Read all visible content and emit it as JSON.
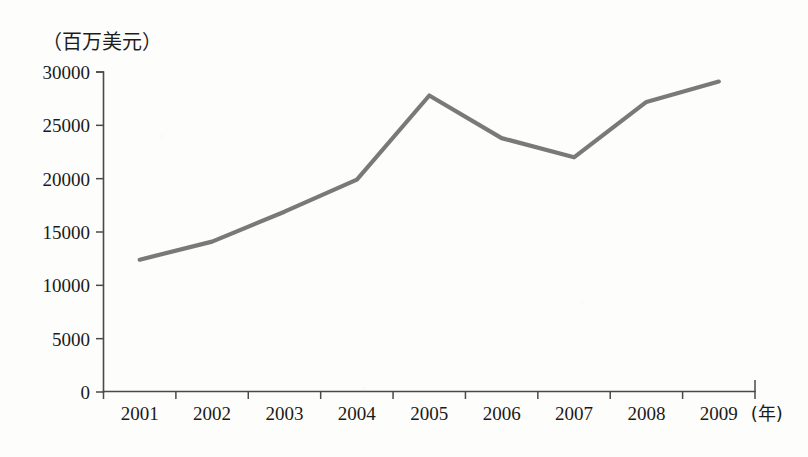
{
  "chart_data": {
    "type": "line",
    "title": "",
    "subtitle": "",
    "ylabel": "（百万美元）",
    "xlabel": "(年)",
    "categories": [
      "2001",
      "2002",
      "2003",
      "2004",
      "2005",
      "2006",
      "2007",
      "2008",
      "2009"
    ],
    "values": [
      12400,
      14100,
      16900,
      19900,
      27800,
      23800,
      22000,
      27200,
      29100
    ],
    "series": [
      {
        "name": "",
        "values": [
          12400,
          14100,
          16900,
          19900,
          27800,
          23800,
          22000,
          27200,
          29100
        ]
      }
    ],
    "ylim": [
      0,
      30000
    ],
    "ytick_labels": [
      "0",
      "5000",
      "10000",
      "15000",
      "20000",
      "25000",
      "30000"
    ],
    "ytick_values": [
      0,
      5000,
      10000,
      15000,
      20000,
      25000,
      30000
    ],
    "xtick_labels": [
      "2001",
      "2002",
      "2003",
      "2004",
      "2005",
      "2006",
      "2007",
      "2008",
      "2009"
    ],
    "grid": false,
    "legend": false,
    "legend_position": "none",
    "line_color": "#6e6e6e",
    "axis_color": "#4a4a4a",
    "background_color": "#fdfdfb",
    "text_color": "#1a1a1a"
  },
  "axis": {
    "unit_label": "（百万美元）",
    "year_suffix": "(年)"
  }
}
